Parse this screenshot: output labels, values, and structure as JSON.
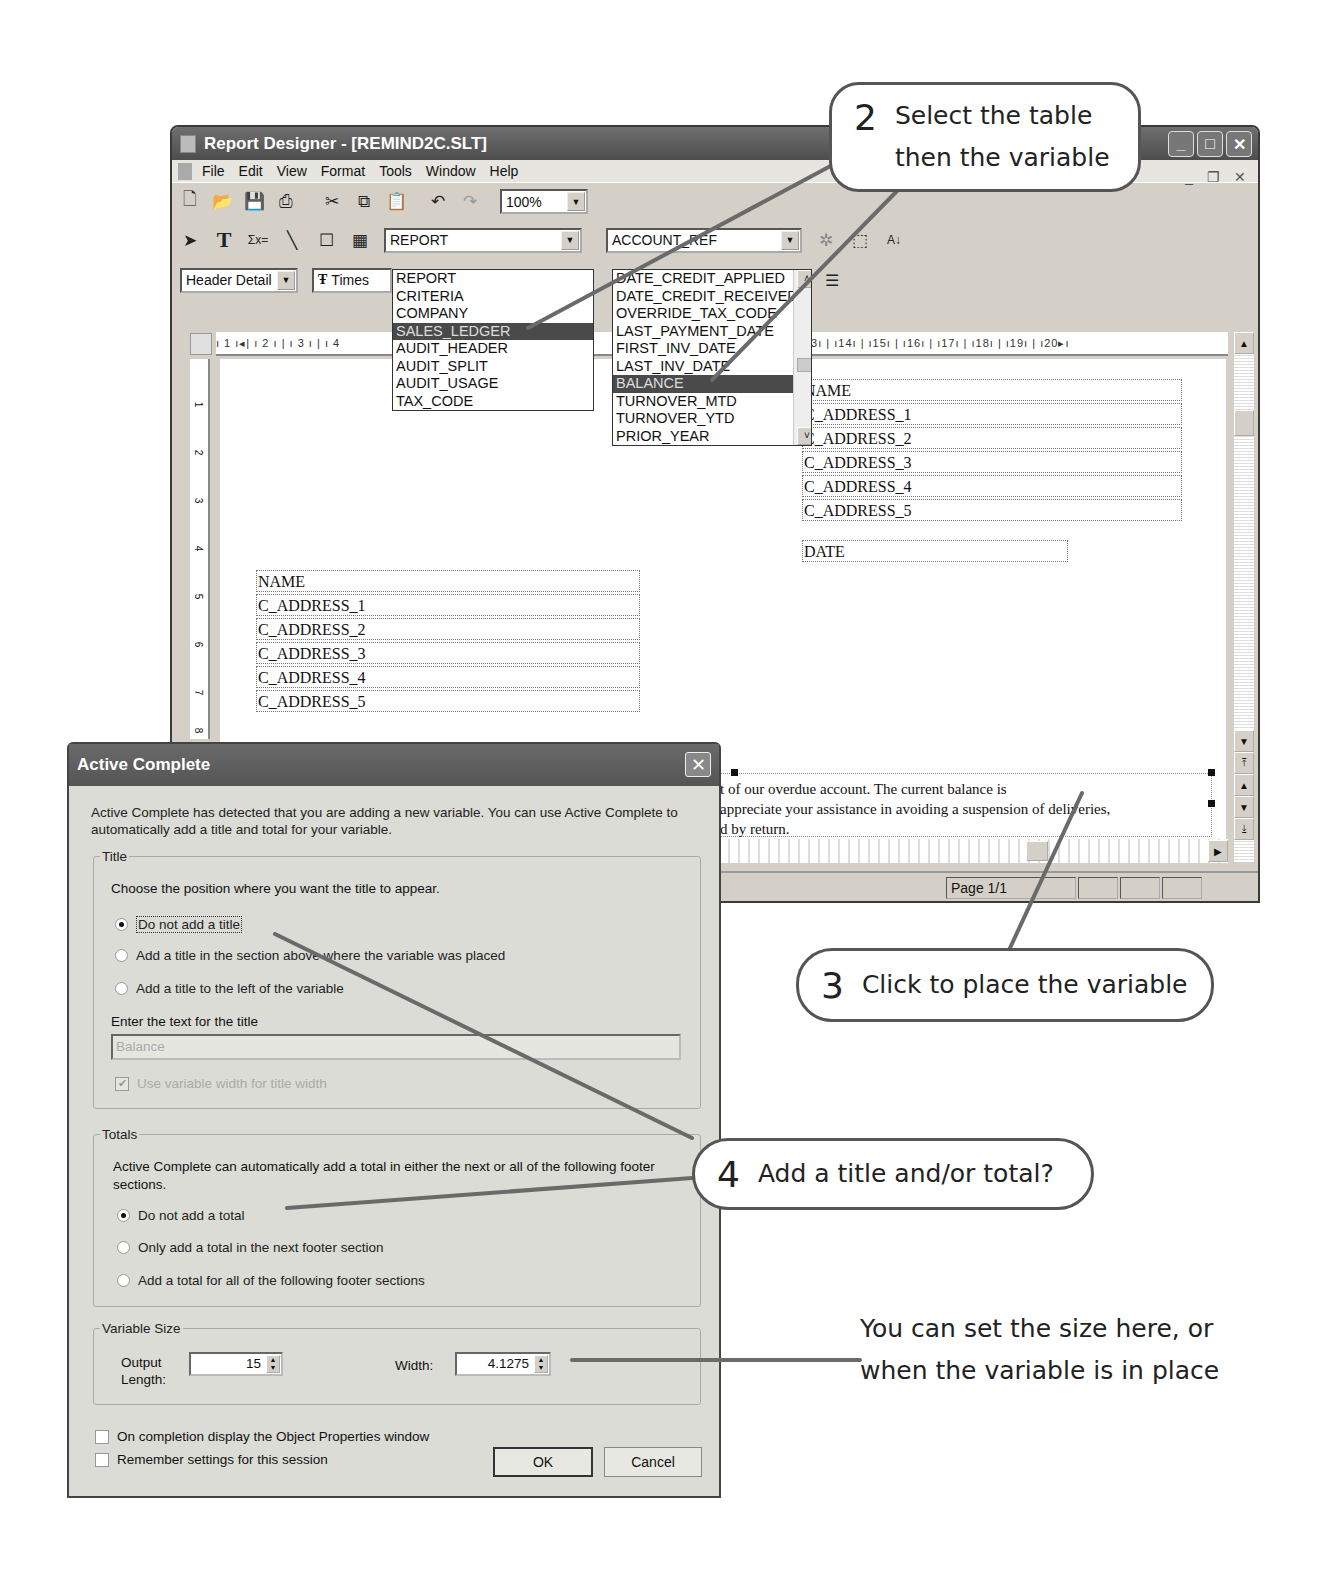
{
  "window": {
    "title": "Report Designer - [REMIND2C.SLT]",
    "controls": [
      "minimize",
      "maximize",
      "close"
    ],
    "mdi_controls": [
      "minimize",
      "restore",
      "close"
    ]
  },
  "menubar": {
    "items": [
      "File",
      "Edit",
      "View",
      "Format",
      "Tools",
      "Window",
      "Help"
    ]
  },
  "toolbar": {
    "icons": [
      "new-file-icon",
      "open-folder-icon",
      "save-icon",
      "print-icon",
      "cut-icon",
      "copy-icon",
      "paste-icon",
      "undo-icon",
      "redo-icon"
    ],
    "zoom": "100%"
  },
  "toolbar2": {
    "tools": [
      "pointer-icon",
      "text-tool-icon",
      "expression-tool-icon",
      "line-tool-icon",
      "box-tool-icon",
      "picture-tool-icon"
    ],
    "table_combo": "REPORT",
    "variable_combo": "ACCOUNT_REF",
    "extra_icons": [
      "wizard-icon",
      "select-icon",
      "sort-az-icon"
    ]
  },
  "toolbar3": {
    "section_combo": "Header Detail",
    "font_combo": "Times",
    "align_icon": "justify-icon"
  },
  "table_dropdown": {
    "items": [
      "REPORT",
      "CRITERIA",
      "COMPANY",
      "SALES_LEDGER",
      "AUDIT_HEADER",
      "AUDIT_SPLIT",
      "AUDIT_USAGE",
      "TAX_CODE"
    ],
    "selected": "SALES_LEDGER"
  },
  "variable_dropdown": {
    "items": [
      "DATE_CREDIT_APPLIED",
      "DATE_CREDIT_RECEIVED",
      "OVERRIDE_TAX_CODE",
      "LAST_PAYMENT_DATE",
      "FIRST_INV_DATE",
      "LAST_INV_DATE",
      "BALANCE",
      "TURNOVER_MTD",
      "TURNOVER_YTD",
      "PRIOR_YEAR"
    ],
    "selected": "BALANCE"
  },
  "ruler": {
    "h_labels": "1 1 | 2 | 3 | 4 ...| 13 | 14 | 15 | 16 | 17 | 18 | 19 | 20",
    "h_left": "ı 1 ı◂| ı 2 ı | ı 3 ı | ı 4",
    "h_right": "| ı13ı | ı14ı | ı15ı | ı16ı | ı17ı | ı18ı | ı19ı | ı20▸ı",
    "v_labels": [
      "1",
      "2",
      "3",
      "4",
      "5",
      "6",
      "7",
      "8"
    ]
  },
  "report": {
    "right_block": [
      "NAME",
      "C_ADDRESS_1",
      "C_ADDRESS_2",
      "C_ADDRESS_3",
      "C_ADDRESS_4",
      "C_ADDRESS_5"
    ],
    "date_field": "DATE",
    "left_block": [
      "NAME",
      "C_ADDRESS_1",
      "C_ADDRESS_2",
      "C_ADDRESS_3",
      "C_ADDRESS_4",
      "C_ADDRESS_5"
    ],
    "body_lines": [
      "t of our overdue account.  The current balance is",
      "appreciate your assistance in avoiding a suspension of deliveries,",
      "d by return."
    ]
  },
  "statusbar": {
    "page": "Page 1/1"
  },
  "dialog": {
    "title": "Active Complete",
    "intro": "Active Complete has detected that you are adding a new variable. You can use Active Complete to automatically add a title and total for your variable.",
    "title_group": {
      "legend": "Title",
      "prompt": "Choose the position where you want the title to appear.",
      "options": [
        {
          "label": "Do not add a title",
          "checked": true
        },
        {
          "label": "Add a title in the section above where the variable was placed",
          "checked": false
        },
        {
          "label": "Add a title to the left of the variable",
          "checked": false
        }
      ],
      "text_label": "Enter the text for the title",
      "text_value": "Balance",
      "use_width_label": "Use variable width for title width",
      "use_width_checked": true
    },
    "totals_group": {
      "legend": "Totals",
      "prompt": "Active Complete can automatically add a total in either the next or all of the following footer sections.",
      "options": [
        {
          "label": "Do not add a total",
          "checked": true
        },
        {
          "label": "Only add a total in the next footer section",
          "checked": false
        },
        {
          "label": "Add a total for all of the following footer sections",
          "checked": false
        }
      ]
    },
    "size_group": {
      "legend": "Variable Size",
      "output_length_label": "Output Length:",
      "output_length_value": "15",
      "width_label": "Width:",
      "width_value": "4.1275"
    },
    "checkboxes": [
      {
        "label": "On completion display the Object Properties window",
        "checked": false
      },
      {
        "label": "Remember settings for this session",
        "checked": false
      }
    ],
    "ok_label": "OK",
    "cancel_label": "Cancel"
  },
  "callouts": {
    "step2": {
      "num": "2",
      "line1": "Select the table",
      "line2": "then the variable"
    },
    "step3": {
      "num": "3",
      "text": "Click to place the variable"
    },
    "step4": {
      "num": "4",
      "text": "Add a title and/or total?"
    },
    "note_line1": "You can set the size here, or",
    "note_line2": "when the variable is in place"
  },
  "colors": {
    "callout_border": "#555555",
    "selection": "#4a4a4a",
    "dialog_bg": "#dcdcd6"
  }
}
